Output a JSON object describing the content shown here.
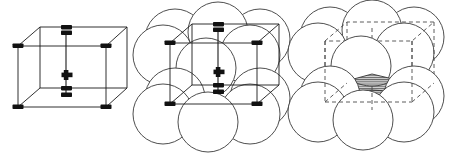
{
  "figure": {
    "width": 455,
    "height": 157,
    "background": "#ffffff",
    "panel_count": 3
  },
  "style": {
    "line_color": "#1a1a1a",
    "line_width": 0.9,
    "circle_stroke": "#3a3a3a",
    "circle_stroke_width": 0.9,
    "circle_fill": "#ffffff",
    "vertex_marker_color": "#111111",
    "dashed_color": "#4a4a4a",
    "dash_pattern": "4,3",
    "hatch_color": "#555555",
    "hatch_fill": "#c9c9c9"
  },
  "panels": [
    {
      "id": "panel-1",
      "name": "reduced-sphere-unit-cell",
      "label": "Reduced-sphere BCC unit cell",
      "origin_x": 0,
      "origin_y": 0,
      "cube": {
        "name": "bcc-cube-solid",
        "stroke_style": "solid",
        "vertices": {
          "front_top_left": [
            18,
            46
          ],
          "front_top_right": [
            106,
            46
          ],
          "front_bottom_left": [
            18,
            107
          ],
          "front_bottom_right": [
            106,
            107
          ],
          "back_top_left": [
            40,
            27
          ],
          "back_top_right": [
            127,
            27
          ],
          "back_bottom_left": [
            40,
            88
          ],
          "back_bottom_right": [
            127,
            88
          ]
        },
        "center_marker": {
          "name": "body-center-atom",
          "symbol": "plus",
          "x": 66,
          "y": 75,
          "size": 11
        },
        "corner_markers": 8,
        "corner_marker_shape": "rectangle"
      }
    },
    {
      "id": "panel-2",
      "name": "hard-sphere-packing-with-cell",
      "label": "Hard-sphere BCC model with unit cell",
      "origin_x": 150,
      "origin_y": 0,
      "sphere_radius": 30,
      "spheres": [
        {
          "name": "sphere-back-top-left",
          "cx": 175,
          "cy": 39
        },
        {
          "name": "sphere-back-top-right",
          "cx": 260,
          "cy": 39
        },
        {
          "name": "sphere-back-top-mid",
          "cx": 218,
          "cy": 32
        },
        {
          "name": "sphere-front-top-left",
          "cx": 163,
          "cy": 55
        },
        {
          "name": "sphere-front-top-right",
          "cx": 250,
          "cy": 55
        },
        {
          "name": "sphere-center",
          "cx": 206,
          "cy": 68
        },
        {
          "name": "sphere-back-bottom-left",
          "cx": 175,
          "cy": 98
        },
        {
          "name": "sphere-back-bottom-right",
          "cx": 260,
          "cy": 98
        },
        {
          "name": "sphere-front-bottom-left",
          "cx": 163,
          "cy": 114
        },
        {
          "name": "sphere-front-bottom-right",
          "cx": 250,
          "cy": 114
        },
        {
          "name": "sphere-front-bottom-mid",
          "cx": 208,
          "cy": 122
        }
      ],
      "cube": {
        "name": "bcc-cube-solid-overlay",
        "stroke_style": "solid",
        "vertices": {
          "front_top_left": [
            170,
            43
          ],
          "front_top_right": [
            257,
            43
          ],
          "front_bottom_left": [
            170,
            104
          ],
          "front_bottom_right": [
            257,
            104
          ],
          "back_top_left": [
            192,
            24
          ],
          "back_top_right": [
            279,
            24
          ],
          "back_bottom_left": [
            192,
            85
          ],
          "back_bottom_right": [
            279,
            85
          ]
        },
        "center_marker": {
          "name": "body-center-atom",
          "symbol": "plus",
          "x": 218,
          "y": 72,
          "size": 11
        }
      }
    },
    {
      "id": "panel-3",
      "name": "hard-sphere-with-interstitial-site",
      "label": "Hard-sphere BCC model with shaded interstitial void",
      "origin_x": 300,
      "origin_y": 0,
      "sphere_radius": 30,
      "spheres": [
        {
          "name": "sphere-back-top-left",
          "cx": 330,
          "cy": 37
        },
        {
          "name": "sphere-back-top-right",
          "cx": 414,
          "cy": 37
        },
        {
          "name": "sphere-back-top-mid",
          "cx": 372,
          "cy": 30
        },
        {
          "name": "sphere-front-top-left",
          "cx": 318,
          "cy": 53
        },
        {
          "name": "sphere-front-top-right",
          "cx": 404,
          "cy": 53
        },
        {
          "name": "sphere-center",
          "cx": 361,
          "cy": 66
        },
        {
          "name": "sphere-back-bottom-left",
          "cx": 330,
          "cy": 96
        },
        {
          "name": "sphere-back-bottom-right",
          "cx": 414,
          "cy": 96
        },
        {
          "name": "sphere-front-bottom-left",
          "cx": 318,
          "cy": 112
        },
        {
          "name": "sphere-front-bottom-right",
          "cx": 404,
          "cy": 112
        },
        {
          "name": "sphere-front-bottom-mid",
          "cx": 363,
          "cy": 120
        }
      ],
      "cube": {
        "name": "bcc-cube-dashed-overlay",
        "stroke_style": "dashed",
        "vertices": {
          "front_top_left": [
            325,
            41
          ],
          "front_top_right": [
            412,
            41
          ],
          "front_bottom_left": [
            325,
            102
          ],
          "front_bottom_right": [
            412,
            102
          ],
          "back_top_left": [
            347,
            22
          ],
          "back_top_right": [
            434,
            22
          ],
          "back_bottom_left": [
            347,
            83
          ],
          "back_bottom_right": [
            434,
            83
          ]
        }
      },
      "interstitial_site": {
        "name": "tetrahedral-void-shaded",
        "fill_pattern": "horizontal-hatch",
        "label": "interstitial void",
        "centroid": [
          372,
          88
        ]
      }
    }
  ]
}
